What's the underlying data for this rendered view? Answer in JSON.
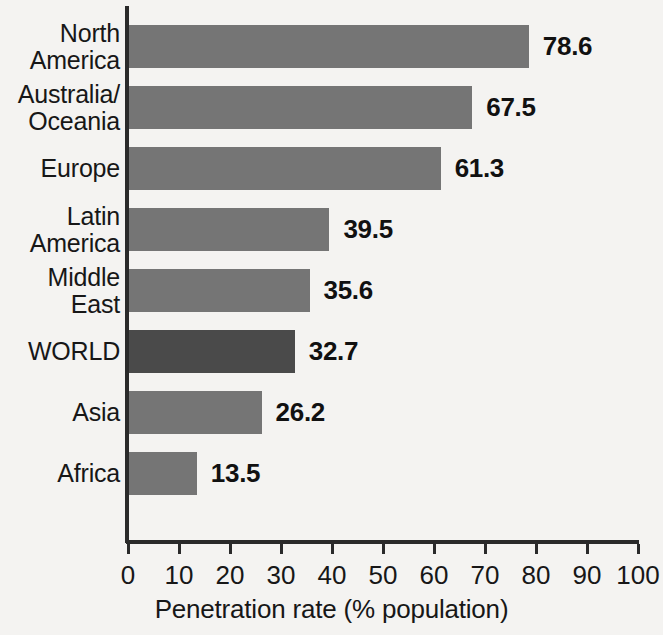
{
  "chart_data": {
    "type": "bar",
    "orientation": "horizontal",
    "title": "",
    "xlabel": "Penetration rate (% population)",
    "ylabel": "",
    "xlim": [
      0,
      100
    ],
    "xticks": [
      0,
      10,
      20,
      30,
      40,
      50,
      60,
      70,
      80,
      90,
      100
    ],
    "xtick_labels": [
      "0",
      "10",
      "20",
      "30",
      "40",
      "50",
      "60",
      "70",
      "80",
      "90",
      "100"
    ],
    "grid": false,
    "legend": null,
    "categories": [
      "North\nAmerica",
      "Australia/\nOceania",
      "Europe",
      "Latin\nAmerica",
      "Middle\nEast",
      "WORLD",
      "Asia",
      "Africa"
    ],
    "values": [
      78.6,
      67.5,
      61.3,
      39.5,
      35.6,
      32.7,
      26.2,
      13.5
    ],
    "value_labels": [
      "78.6",
      "67.5",
      "61.3",
      "39.5",
      "35.6",
      "32.7",
      "26.2",
      "13.5"
    ],
    "bar_colors": [
      "#757575",
      "#757575",
      "#757575",
      "#757575",
      "#757575",
      "#4a4a4a",
      "#757575",
      "#757575"
    ],
    "highlight_category": "WORLD",
    "colors": {
      "background": "#f4f3f1",
      "bar_default": "#757575",
      "bar_highlight": "#4a4a4a",
      "axis": "#2a2a2a",
      "text": "#171717"
    }
  }
}
